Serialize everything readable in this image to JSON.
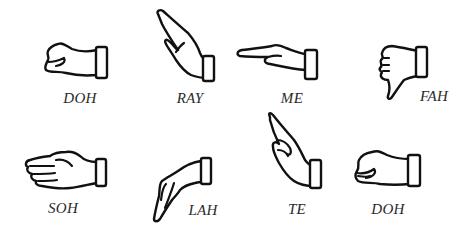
{
  "figure": {
    "signs": [
      {
        "id": "doh-1",
        "label": "DOH",
        "gesture": "closed fist, knuckles forward"
      },
      {
        "id": "ray",
        "label": "RAY",
        "gesture": "flat hand slanting upward"
      },
      {
        "id": "me",
        "label": "ME",
        "gesture": "flat hand held horizontally"
      },
      {
        "id": "fah",
        "label": "FAH",
        "gesture": "fist with thumb pointing down"
      },
      {
        "id": "soh",
        "label": "SOH",
        "gesture": "open hand, palm facing body"
      },
      {
        "id": "lah",
        "label": "LAH",
        "gesture": "relaxed hand hanging downward"
      },
      {
        "id": "te",
        "label": "TE",
        "gesture": "index finger pointing upward diagonally"
      },
      {
        "id": "doh-2",
        "label": "DOH",
        "gesture": "closed fist, knuckles forward (high)"
      }
    ]
  }
}
